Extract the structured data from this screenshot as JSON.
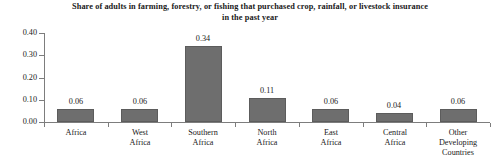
{
  "chart_data": {
    "type": "bar",
    "title": "Share of adults in farming, forestry, or fishing that purchased crop, rainfall, or livestock insurance in the past year",
    "title_lines": [
      "Share of adults in farming, forestry, or fishing that purchased crop, rainfall, or livestock insurance",
      "in the past year"
    ],
    "xlabel": "",
    "ylabel": "",
    "ylim": [
      0,
      0.4
    ],
    "grid": false,
    "legend": false,
    "bar_color": "#6e6e6e",
    "axis_color": "#7d7d7d",
    "background_color": "#ffffff",
    "ytick_labels": [
      "0.40",
      "0.30",
      "0.20",
      "0.10",
      "0.00"
    ],
    "ytick_values": [
      0.4,
      0.3,
      0.2,
      0.1,
      0.0
    ],
    "categories": [
      "Africa",
      "West Africa",
      "Southern Africa",
      "North Africa",
      "East Africa",
      "Central Africa",
      "Other Developing Countries"
    ],
    "category_lines": [
      [
        "Africa"
      ],
      [
        "West",
        "Africa"
      ],
      [
        "Southern",
        "Africa"
      ],
      [
        "North",
        "Africa"
      ],
      [
        "East",
        "Africa"
      ],
      [
        "Central",
        "Africa"
      ],
      [
        "Other",
        "Developing",
        "Countries"
      ]
    ],
    "values": [
      0.06,
      0.06,
      0.34,
      0.11,
      0.06,
      0.04,
      0.06
    ],
    "value_labels": [
      "0.06",
      "0.06",
      "0.34",
      "0.11",
      "0.06",
      "0.04",
      "0.06"
    ]
  }
}
